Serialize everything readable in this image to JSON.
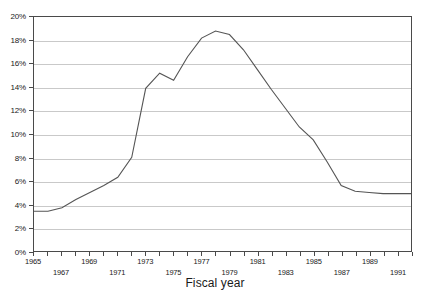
{
  "chart_data": {
    "type": "line",
    "title": "",
    "xlabel": "Fiscal year",
    "ylabel": "",
    "xlim": [
      1965,
      1992
    ],
    "ylim": [
      0,
      20
    ],
    "grid": true,
    "legend": null,
    "y_tick_labels": [
      "0%",
      "2%",
      "4%",
      "6%",
      "8%",
      "10%",
      "12%",
      "14%",
      "16%",
      "18%",
      "20%"
    ],
    "y_tick_values": [
      0,
      2,
      4,
      6,
      8,
      10,
      12,
      14,
      16,
      18,
      20
    ],
    "x_tick_values": [
      1965,
      1966,
      1967,
      1968,
      1969,
      1970,
      1971,
      1972,
      1973,
      1974,
      1975,
      1976,
      1977,
      1978,
      1979,
      1980,
      1981,
      1982,
      1983,
      1984,
      1985,
      1986,
      1987,
      1988,
      1989,
      1990,
      1991,
      1992
    ],
    "x_tick_labels_upper": [
      1965,
      1969,
      1973,
      1977,
      1981,
      1985,
      1989
    ],
    "x_tick_labels_lower": [
      1967,
      1971,
      1975,
      1979,
      1983,
      1987,
      1991
    ],
    "x": [
      1965,
      1966,
      1967,
      1968,
      1969,
      1970,
      1971,
      1972,
      1973,
      1974,
      1975,
      1976,
      1977,
      1978,
      1979,
      1980,
      1981,
      1982,
      1983,
      1984,
      1985,
      1986,
      1987,
      1988,
      1989,
      1990,
      1991,
      1992
    ],
    "values": [
      3.4,
      3.4,
      3.7,
      4.4,
      5.0,
      5.6,
      6.3,
      8.0,
      13.9,
      15.2,
      14.6,
      16.6,
      18.2,
      18.8,
      18.5,
      17.2,
      15.5,
      13.8,
      12.2,
      10.6,
      9.5,
      7.6,
      5.6,
      5.1,
      5.0,
      4.9,
      4.9,
      4.9
    ],
    "line_color": "#555555",
    "grid_color": "#c9c9c9",
    "frame_color": "#4a4a4a"
  }
}
